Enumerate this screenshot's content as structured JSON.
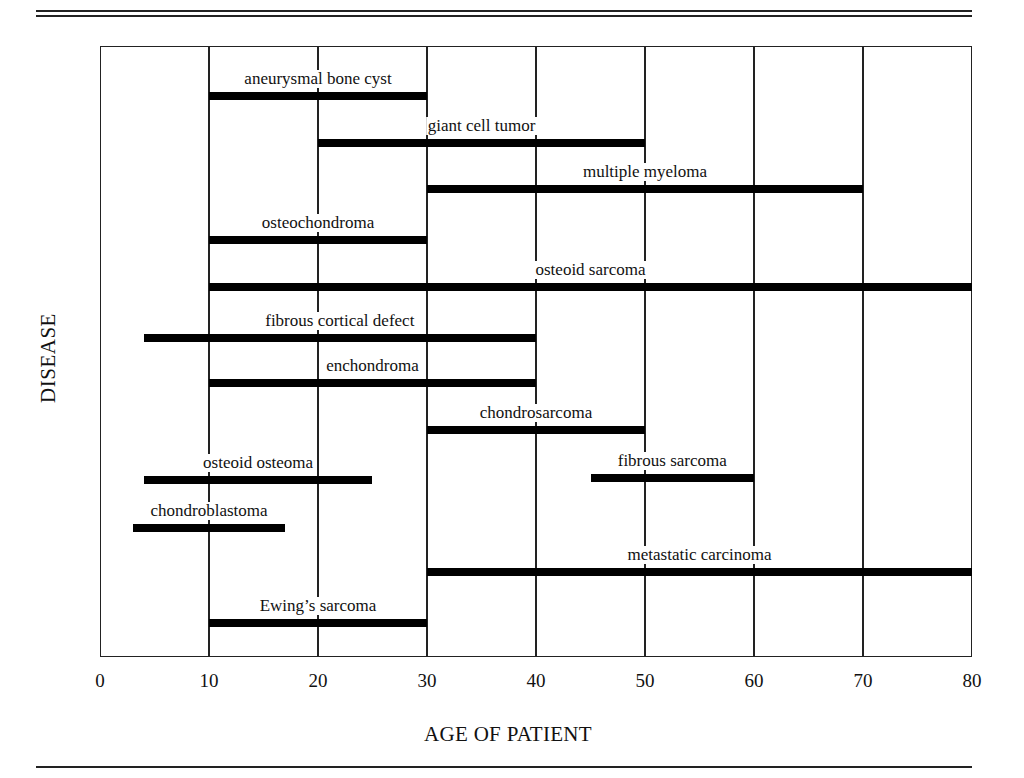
{
  "chart_data": {
    "type": "range-bar",
    "title": "",
    "xlabel": "AGE OF PATIENT",
    "ylabel": "DISEASE",
    "xlim": [
      0,
      80
    ],
    "xticks": [
      0,
      10,
      20,
      30,
      40,
      50,
      60,
      70,
      80
    ],
    "grid": true,
    "legend": null,
    "series": [
      {
        "name": "aneurysmal bone cyst",
        "start": 10,
        "end": 30,
        "y": 96
      },
      {
        "name": "giant cell tumor",
        "start": 20,
        "end": 50,
        "y": 143
      },
      {
        "name": "multiple myeloma",
        "start": 30,
        "end": 70,
        "y": 189
      },
      {
        "name": "osteochondroma",
        "start": 10,
        "end": 30,
        "y": 240
      },
      {
        "name": "osteoid sarcoma",
        "start": 10,
        "end": 80,
        "y": 287
      },
      {
        "name": "fibrous cortical defect",
        "start": 4,
        "end": 40,
        "y": 338
      },
      {
        "name": "enchondroma",
        "start": 10,
        "end": 40,
        "y": 383
      },
      {
        "name": "chondrosarcoma",
        "start": 30,
        "end": 50,
        "y": 430
      },
      {
        "name": "osteoid osteoma",
        "start": 4,
        "end": 25,
        "y": 480
      },
      {
        "name": "fibrous sarcoma",
        "start": 45,
        "end": 60,
        "y": 478
      },
      {
        "name": "chondroblastoma",
        "start": 3,
        "end": 17,
        "y": 528
      },
      {
        "name": "metastatic carcinoma",
        "start": 30,
        "end": 80,
        "y": 572
      },
      {
        "name": "Ewing’s sarcoma",
        "start": 10,
        "end": 30,
        "y": 623
      }
    ]
  },
  "axis": {
    "x_label": "AGE OF PATIENT",
    "y_label": "DISEASE",
    "ticks": [
      "0",
      "10",
      "20",
      "30",
      "40",
      "50",
      "60",
      "70",
      "80"
    ]
  }
}
